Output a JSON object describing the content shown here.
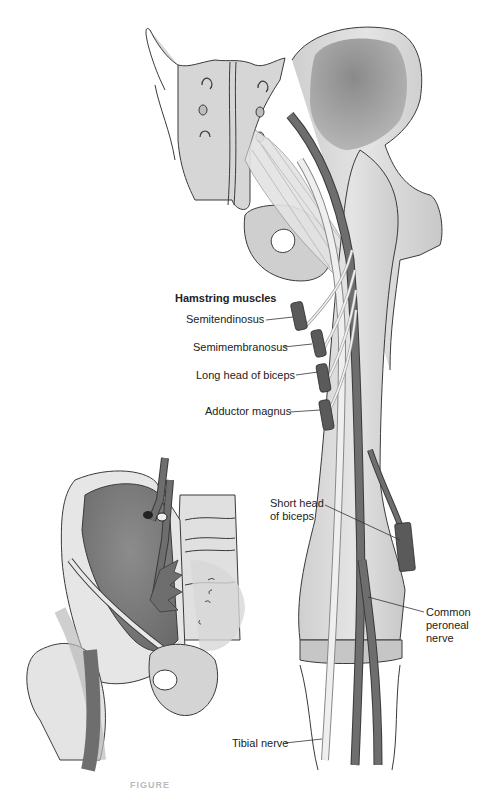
{
  "figure": {
    "title": "Hamstring muscles",
    "caption_partial": "FIGURE",
    "colors": {
      "bone_light": "#dcdcdc",
      "bone_mid": "#bdbdbd",
      "pelvis_dark": "#7a7a7a",
      "nerve_dark": "#6e6e6e",
      "nerve_pale": "#ececec",
      "muscle": "#5a5a5a",
      "outline": "#3a3a3a"
    }
  },
  "labels": {
    "hamstring_heading": "Hamstring muscles",
    "semitendinosus": "Semitendinosus",
    "semimembranosus": "Semimembranosus",
    "long_head_biceps": "Long head of biceps",
    "adductor_magnus": "Adductor magnus",
    "short_head_biceps_line1": "Short head",
    "short_head_biceps_line2": "of biceps",
    "common_peroneal_line1": "Common",
    "common_peroneal_line2": "peroneal",
    "common_peroneal_line3": "nerve",
    "tibial_nerve": "Tibial nerve"
  }
}
